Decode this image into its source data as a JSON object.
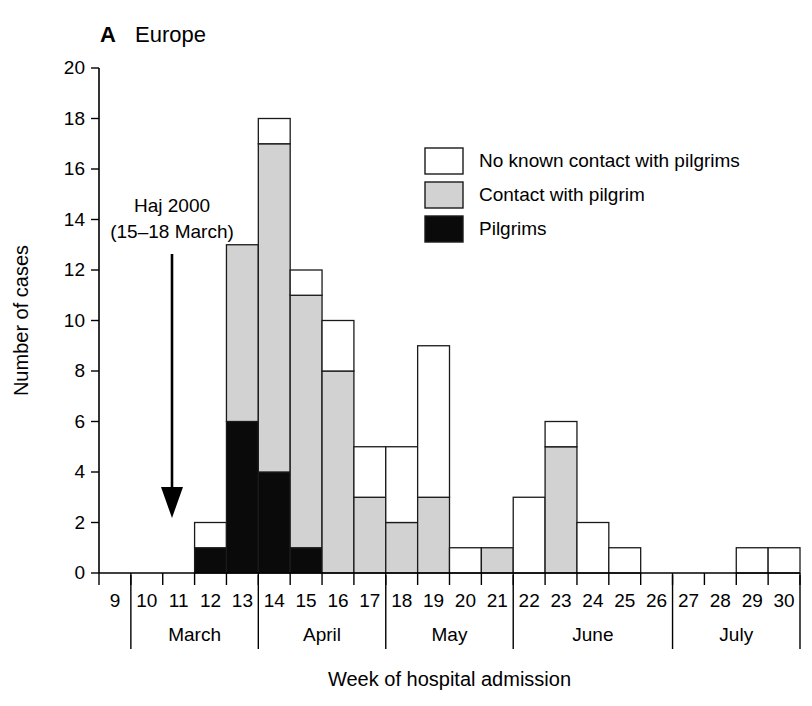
{
  "panel": {
    "letter": "A",
    "title": "Europe"
  },
  "annotation": {
    "line1": "Haj 2000",
    "line2": "(15–18 March)"
  },
  "axes": {
    "ylabel": "Number of cases",
    "xlabel": "Week of hospital admission",
    "yticks": [
      "0",
      "2",
      "4",
      "6",
      "8",
      "10",
      "12",
      "14",
      "16",
      "18",
      "20"
    ],
    "xticks": [
      "9",
      "10",
      "11",
      "12",
      "13",
      "14",
      "15",
      "16",
      "17",
      "18",
      "19",
      "20",
      "21",
      "22",
      "23",
      "24",
      "25",
      "26",
      "27",
      "28",
      "29",
      "30"
    ],
    "months": [
      "March",
      "April",
      "May",
      "June",
      "July"
    ]
  },
  "legend": {
    "items": [
      {
        "label": "No known contact with pilgrims",
        "color": "#ffffff"
      },
      {
        "label": "Contact with pilgrim",
        "color": "#d2d2d2"
      },
      {
        "label": "Pilgrims",
        "color": "#0a0a0a"
      }
    ]
  },
  "chart_data": {
    "type": "bar",
    "title": "Europe",
    "xlabel": "Week of hospital admission",
    "ylabel": "Number of cases",
    "ylim": [
      0,
      20
    ],
    "grid": false,
    "legend_position": "top-right",
    "stacked": true,
    "categories": [
      "9",
      "10",
      "11",
      "12",
      "13",
      "14",
      "15",
      "16",
      "17",
      "18",
      "19",
      "20",
      "21",
      "22",
      "23",
      "24",
      "25",
      "26",
      "27",
      "28",
      "29",
      "30"
    ],
    "series": [
      {
        "name": "Pilgrims",
        "color": "#0a0a0a",
        "values": [
          0,
          0,
          0,
          1,
          6,
          4,
          1,
          0,
          0,
          0,
          0,
          0,
          0,
          0,
          0,
          0,
          0,
          0,
          0,
          0,
          0,
          0
        ]
      },
      {
        "name": "Contact with pilgrim",
        "color": "#d2d2d2",
        "values": [
          0,
          0,
          0,
          0,
          7,
          13,
          10,
          8,
          3,
          2,
          3,
          0,
          1,
          0,
          5,
          0,
          0,
          0,
          0,
          0,
          0,
          0
        ]
      },
      {
        "name": "No known contact with pilgrims",
        "color": "#ffffff",
        "values": [
          0,
          0,
          0,
          1,
          0,
          1,
          1,
          2,
          2,
          3,
          6,
          1,
          0,
          3,
          1,
          2,
          1,
          0,
          0,
          0,
          1,
          1
        ]
      }
    ],
    "totals": [
      0,
      0,
      0,
      2,
      13,
      18,
      12,
      10,
      5,
      5,
      9,
      1,
      1,
      3,
      6,
      2,
      1,
      0,
      0,
      0,
      1,
      1
    ],
    "month_groups": [
      {
        "month": "March",
        "weeks": [
          "10",
          "11",
          "12",
          "13"
        ]
      },
      {
        "month": "April",
        "weeks": [
          "14",
          "15",
          "16",
          "17"
        ]
      },
      {
        "month": "May",
        "weeks": [
          "18",
          "19",
          "20",
          "21"
        ]
      },
      {
        "month": "June",
        "weeks": [
          "22",
          "23",
          "24",
          "25",
          "26"
        ]
      },
      {
        "month": "July",
        "weeks": [
          "27",
          "28",
          "29",
          "30"
        ]
      }
    ],
    "annotations": [
      {
        "text": "Haj 2000 (15–18 March)",
        "type": "arrow",
        "at_week": "12"
      }
    ]
  }
}
